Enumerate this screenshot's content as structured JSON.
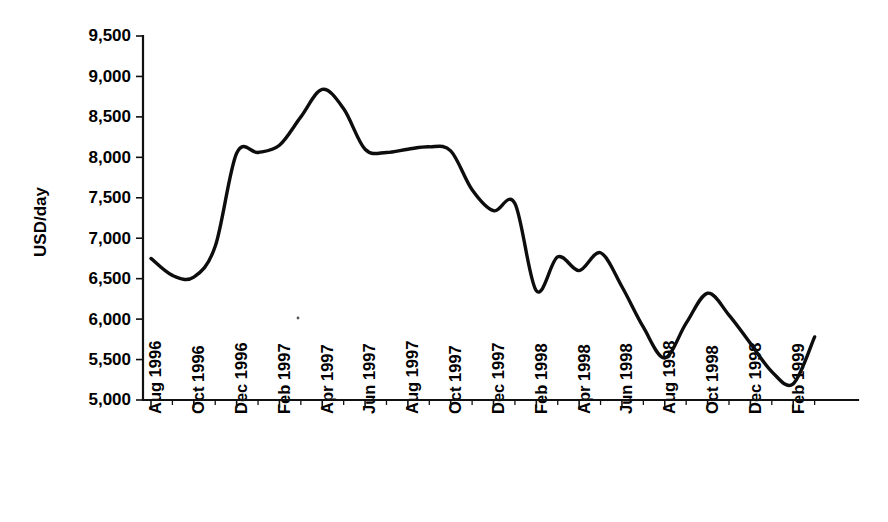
{
  "chart_data": {
    "type": "line",
    "title": "",
    "xlabel": "",
    "ylabel": "USD/day",
    "ylim": [
      5000,
      9500
    ],
    "ytick_step": 500,
    "grid": false,
    "legend": null,
    "line_color": "#0d0d0d",
    "ytick_labels": [
      "9,500",
      "9,000",
      "8,500",
      "8,000",
      "7,500",
      "7,000",
      "6,500",
      "6,000",
      "5,500",
      "5,000"
    ],
    "ytick_values": [
      9500,
      9000,
      8500,
      8000,
      7500,
      7000,
      6500,
      6000,
      5500,
      5000
    ],
    "xtick_labels": [
      "Aug 1996",
      "Oct 1996",
      "Dec 1996",
      "Feb 1997",
      "Apr 1997",
      "Jun 1997",
      "Aug 1997",
      "Oct 1997",
      "Dec 1997",
      "Feb 1998",
      "Apr 1998",
      "Jun 1998",
      "Aug 1998",
      "Oct 1998",
      "Dec 1998",
      "Feb 1999"
    ],
    "x_months": [
      "Aug 1996",
      "Sep 1996",
      "Oct 1996",
      "Nov 1996",
      "Dec 1996",
      "Jan 1997",
      "Feb 1997",
      "Mar 1997",
      "Apr 1997",
      "May 1997",
      "Jun 1997",
      "Jul 1997",
      "Aug 1997",
      "Sep 1997",
      "Oct 1997",
      "Nov 1997",
      "Dec 1997",
      "Jan 1998",
      "Feb 1998",
      "Mar 1998",
      "Apr 1998",
      "May 1998",
      "Jun 1998",
      "Jul 1998",
      "Aug 1998",
      "Sep 1998",
      "Oct 1998",
      "Nov 1998",
      "Dec 1998",
      "Jan 1999",
      "Feb 1999",
      "Mar 1999"
    ],
    "series": [
      {
        "name": "USD/day",
        "values": [
          6750,
          6540,
          6520,
          6900,
          8050,
          8060,
          8150,
          8500,
          8840,
          8600,
          8100,
          8060,
          8100,
          8130,
          8080,
          7600,
          7340,
          7430,
          6350,
          6770,
          6600,
          6820,
          6400,
          5900,
          5520,
          5950,
          6320,
          6050,
          5700,
          5350,
          5200,
          5780
        ]
      }
    ],
    "annotations": []
  }
}
